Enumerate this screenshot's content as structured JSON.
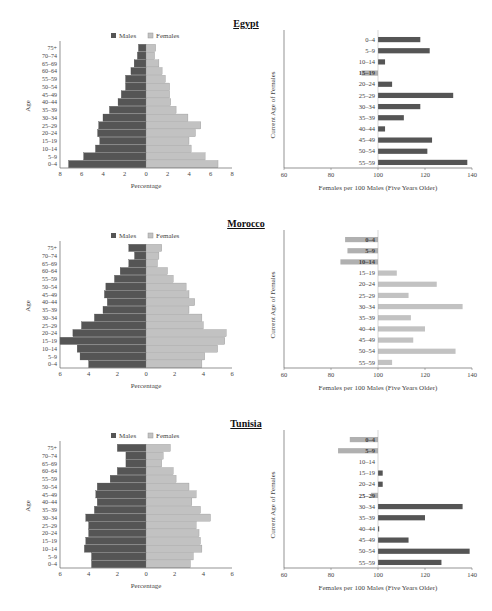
{
  "colors": {
    "males": "#555555",
    "females": "#c2c2c2",
    "axis": "#666666",
    "text": "#444444"
  },
  "legend": {
    "males": "Males",
    "females": "Females"
  },
  "chart_data": [
    {
      "country": "Egypt",
      "type": "bar",
      "subtype": "population-pyramid",
      "title": "Egypt",
      "xlabel": "Percentage",
      "ylabel": "Age",
      "xlim": [
        -8,
        8
      ],
      "xticks": [
        "8",
        "6",
        "4",
        "2",
        "0",
        "2",
        "4",
        "6",
        "8"
      ],
      "categories": [
        "0–4",
        "5–9",
        "10–14",
        "15–19",
        "20–24",
        "25–29",
        "30–34",
        "35–39",
        "40–44",
        "45–49",
        "50–54",
        "55–59",
        "60–64",
        "65–69",
        "70–74",
        "75+"
      ],
      "series": [
        {
          "name": "Males",
          "values": [
            7.2,
            5.8,
            4.7,
            4.3,
            4.5,
            4.4,
            4.0,
            3.4,
            2.6,
            2.3,
            1.9,
            1.9,
            1.4,
            1.1,
            0.8,
            0.7
          ]
        },
        {
          "name": "Females",
          "values": [
            6.7,
            5.5,
            4.2,
            4.0,
            4.6,
            5.1,
            3.9,
            2.8,
            2.3,
            2.2,
            2.2,
            1.8,
            1.5,
            1.2,
            0.8,
            0.9
          ]
        }
      ]
    },
    {
      "country": "Egypt",
      "type": "bar",
      "subtype": "horizontal",
      "xlabel": "Females per 100 Males (Five Years Older)",
      "ylabel": "Current Age of Females",
      "xlim": [
        60,
        140
      ],
      "xticks": [
        "60",
        "80",
        "100",
        "120",
        "140"
      ],
      "categories": [
        "0–4",
        "5–9",
        "10–14",
        "15–19",
        "20–24",
        "25–29",
        "30–34",
        "35–39",
        "40–44",
        "45–49",
        "50–54",
        "55–59"
      ],
      "values": [
        118,
        122,
        103,
        93,
        106,
        132,
        118,
        111,
        103,
        123,
        121,
        138
      ]
    },
    {
      "country": "Morocco",
      "type": "bar",
      "subtype": "population-pyramid",
      "title": "Morocco",
      "xlabel": "Percentage",
      "ylabel": "Age",
      "xlim": [
        -6,
        6
      ],
      "xticks": [
        "6",
        "4",
        "2",
        "0",
        "2",
        "4",
        "6"
      ],
      "categories": [
        "0–4",
        "5–9",
        "10–14",
        "15–19",
        "20–24",
        "25–29",
        "30–34",
        "35–39",
        "40–44",
        "45–49",
        "50–54",
        "55–59",
        "60–64",
        "65–69",
        "70–74",
        "75+"
      ],
      "series": [
        {
          "name": "Males",
          "values": [
            4.0,
            4.6,
            4.8,
            6.0,
            5.1,
            4.5,
            3.6,
            3.0,
            2.7,
            2.9,
            2.8,
            2.2,
            1.8,
            1.2,
            0.8,
            1.2
          ]
        },
        {
          "name": "Females",
          "values": [
            3.9,
            4.1,
            5.0,
            5.5,
            5.6,
            4.0,
            3.9,
            3.0,
            3.4,
            3.0,
            2.8,
            1.9,
            1.5,
            0.8,
            0.9,
            1.1
          ]
        }
      ]
    },
    {
      "country": "Morocco",
      "type": "bar",
      "subtype": "horizontal",
      "xlabel": "Females per 100 Males (Five Years Older)",
      "ylabel": "Current Age of Females",
      "xlim": [
        60,
        140
      ],
      "xticks": [
        "60",
        "80",
        "100",
        "120",
        "140"
      ],
      "categories": [
        "0–4",
        "5–9",
        "10–14",
        "15–19",
        "20–24",
        "25–29",
        "30–34",
        "35–39",
        "40–44",
        "45–49",
        "50–54",
        "55–59"
      ],
      "values": [
        86,
        87,
        84,
        108,
        125,
        113,
        136,
        114,
        120,
        115,
        133,
        106
      ]
    },
    {
      "country": "Tunisia",
      "type": "bar",
      "subtype": "population-pyramid",
      "title": "Tunisia",
      "xlabel": "Percentage",
      "ylabel": "Age",
      "xlim": [
        -6,
        6
      ],
      "xticks": [
        "6",
        "4",
        "2",
        "0",
        "2",
        "4",
        "6"
      ],
      "categories": [
        "0–4",
        "5–9",
        "10–14",
        "15–19",
        "20–24",
        "25–29",
        "30–34",
        "35–39",
        "40–44",
        "45–49",
        "50–54",
        "55–59",
        "60–64",
        "65–69",
        "70–74",
        "75+"
      ],
      "series": [
        {
          "name": "Males",
          "values": [
            3.8,
            3.8,
            4.3,
            4.2,
            4.0,
            4.0,
            4.2,
            3.6,
            3.4,
            3.5,
            3.4,
            2.5,
            2.0,
            1.4,
            1.4,
            2.0
          ]
        },
        {
          "name": "Females",
          "values": [
            3.1,
            3.3,
            3.9,
            3.8,
            3.7,
            3.5,
            4.5,
            3.8,
            3.2,
            3.5,
            3.0,
            2.1,
            1.9,
            1.1,
            1.2,
            1.7
          ]
        }
      ]
    },
    {
      "country": "Tunisia",
      "type": "bar",
      "subtype": "horizontal",
      "xlabel": "Females per 100 Males (Five Years Older)",
      "ylabel": "Current Age of Females",
      "xlim": [
        60,
        140
      ],
      "xticks": [
        "60",
        "80",
        "100",
        "120",
        "140"
      ],
      "categories": [
        "0–4",
        "5–9",
        "10–14",
        "15–19",
        "20–24",
        "25–29",
        "30–34",
        "35–39",
        "40–44",
        "45–49",
        "50–54",
        "55–59"
      ],
      "values": [
        88,
        83,
        100,
        102,
        102,
        97,
        136,
        120,
        100.5,
        113,
        139,
        127
      ]
    }
  ],
  "panels": [
    {
      "title": "Egypt",
      "top": 0
    },
    {
      "title": "Morocco",
      "top": 200
    },
    {
      "title": "Tunisia",
      "top": 400
    }
  ]
}
